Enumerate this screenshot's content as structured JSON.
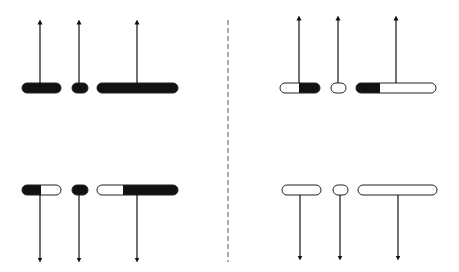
{
  "diagram": {
    "colors": {
      "fill": "#111111",
      "stroke": "#222222",
      "background": "#ffffff",
      "divider": "#555555"
    },
    "divider": {
      "x": 228,
      "y1": 20,
      "y2": 262,
      "style": "dashed"
    },
    "panels": [
      {
        "id": "top-left",
        "arrow_direction": "up",
        "bar_y": 88,
        "arrow_end_y": 22,
        "bars": [
          {
            "x1": 22,
            "x2": 61,
            "fill_from": 22,
            "fill_to": 61,
            "arrow_x": 40
          },
          {
            "x1": 72,
            "x2": 88,
            "fill_from": 72,
            "fill_to": 88,
            "arrow_x": 79
          },
          {
            "x1": 97,
            "x2": 178,
            "fill_from": 97,
            "fill_to": 178,
            "arrow_x": 137
          }
        ]
      },
      {
        "id": "top-right",
        "arrow_direction": "up",
        "bar_y": 88,
        "arrow_end_y": 18,
        "bars": [
          {
            "x1": 280,
            "x2": 320,
            "fill_from": 299,
            "fill_to": 320,
            "arrow_x": 299
          },
          {
            "x1": 331,
            "x2": 346,
            "fill_from": null,
            "fill_to": null,
            "arrow_x": 338
          },
          {
            "x1": 356,
            "x2": 436,
            "fill_from": 356,
            "fill_to": 380,
            "arrow_x": 396
          }
        ]
      },
      {
        "id": "bottom-left",
        "arrow_direction": "down",
        "bar_y": 190,
        "arrow_end_y": 260,
        "bars": [
          {
            "x1": 22,
            "x2": 61,
            "fill_from": 22,
            "fill_to": 41,
            "arrow_x": 40
          },
          {
            "x1": 72,
            "x2": 88,
            "fill_from": 72,
            "fill_to": 88,
            "arrow_x": 79
          },
          {
            "x1": 97,
            "x2": 178,
            "fill_from": 123,
            "fill_to": 178,
            "arrow_x": 137
          }
        ]
      },
      {
        "id": "bottom-right",
        "arrow_direction": "down",
        "bar_y": 190,
        "arrow_end_y": 258,
        "bars": [
          {
            "x1": 282,
            "x2": 321,
            "fill_from": null,
            "fill_to": null,
            "arrow_x": 300
          },
          {
            "x1": 333,
            "x2": 348,
            "fill_from": null,
            "fill_to": null,
            "arrow_x": 340
          },
          {
            "x1": 358,
            "x2": 437,
            "fill_from": null,
            "fill_to": null,
            "arrow_x": 398
          }
        ]
      }
    ]
  }
}
